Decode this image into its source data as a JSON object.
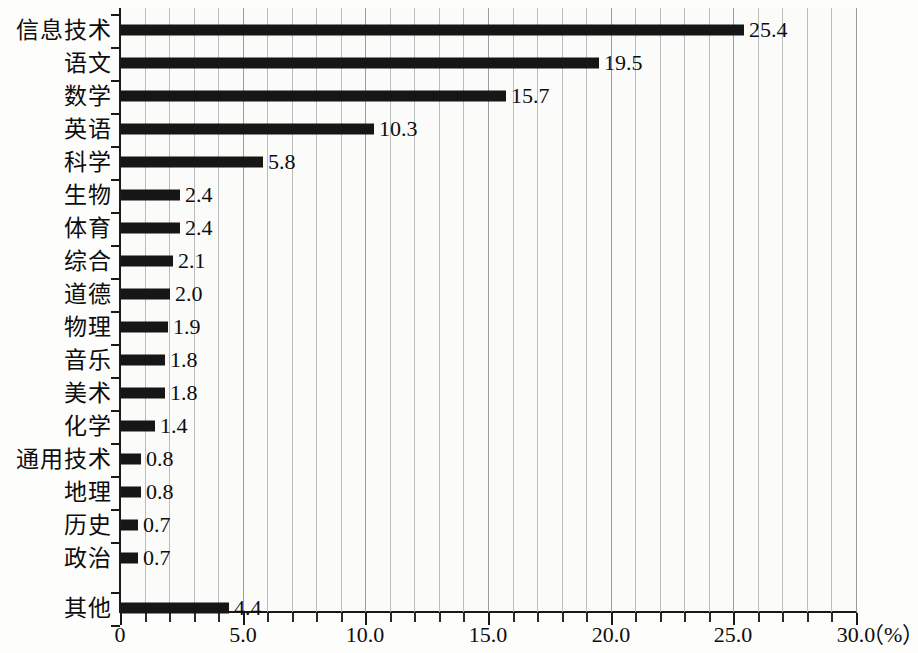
{
  "chart_data": {
    "type": "bar",
    "orientation": "horizontal",
    "title": "",
    "xlabel": "",
    "ylabel": "",
    "unit_label": "（%）",
    "xlim": [
      0,
      30
    ],
    "xticks": [
      "0",
      "5.0",
      "10.0",
      "15.0",
      "20.0",
      "25.0",
      "30.0"
    ],
    "xtick_values": [
      0,
      5,
      10,
      15,
      20,
      25,
      30
    ],
    "minor_tick_step": 1,
    "grid": "vertical",
    "legend": "none",
    "categories": [
      "信息技术",
      "语文",
      "数学",
      "英语",
      "科学",
      "生物",
      "体育",
      "综合",
      "道德",
      "物理",
      "音乐",
      "美术",
      "化学",
      "通用技术",
      "地理",
      "历史",
      "政治",
      "其他"
    ],
    "values": [
      25.4,
      19.5,
      15.7,
      10.3,
      5.8,
      2.4,
      2.4,
      2.1,
      2.0,
      1.9,
      1.8,
      1.8,
      1.4,
      0.8,
      0.8,
      0.7,
      0.7,
      4.4
    ],
    "value_labels": [
      "25.4",
      "19.5",
      "15.7",
      "10.3",
      "5.8",
      "2.4",
      "2.4",
      "2.1",
      "2.0",
      "1.9",
      "1.8",
      "1.8",
      "1.4",
      "0.8",
      "0.8",
      "0.7",
      "0.7",
      "4.4"
    ],
    "bar_color": "#161616",
    "grid_color": "#b9bcbb",
    "axis_color": "#1a1a1a",
    "background_color": "#fbfbfa"
  }
}
